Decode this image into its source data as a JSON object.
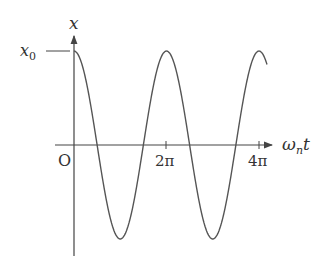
{
  "diagram": {
    "y_axis_label": "x",
    "x_axis_label_main": "ω",
    "x_axis_label_sub": "n",
    "x_axis_label_tail": "t",
    "origin_label": "O",
    "amplitude_label_main": "x",
    "amplitude_label_sub": "0",
    "ticks": [
      "2π",
      "4π"
    ],
    "curve": "x = x0 · cos(ωn t)",
    "colors": {
      "line": "#555555",
      "text": "#333333"
    }
  },
  "chart_data": {
    "type": "line",
    "title": "",
    "xlabel": "ωn t",
    "ylabel": "x",
    "x_ticks": [
      "0",
      "2π",
      "4π"
    ],
    "y_ticks": [
      "x0"
    ],
    "series": [
      {
        "name": "x(t) = x0 cos(ωn t)",
        "x": [
          0,
          1.5708,
          3.1416,
          4.7124,
          6.2832,
          7.854,
          9.4248,
          10.9956,
          12.5664,
          13.2
        ],
        "values": [
          1,
          0,
          -1,
          0,
          1,
          0,
          -1,
          0,
          1,
          0.8
        ]
      }
    ],
    "xlim": [
      0,
      13.5
    ],
    "ylim": [
      -1,
      1
    ],
    "grid": false
  }
}
